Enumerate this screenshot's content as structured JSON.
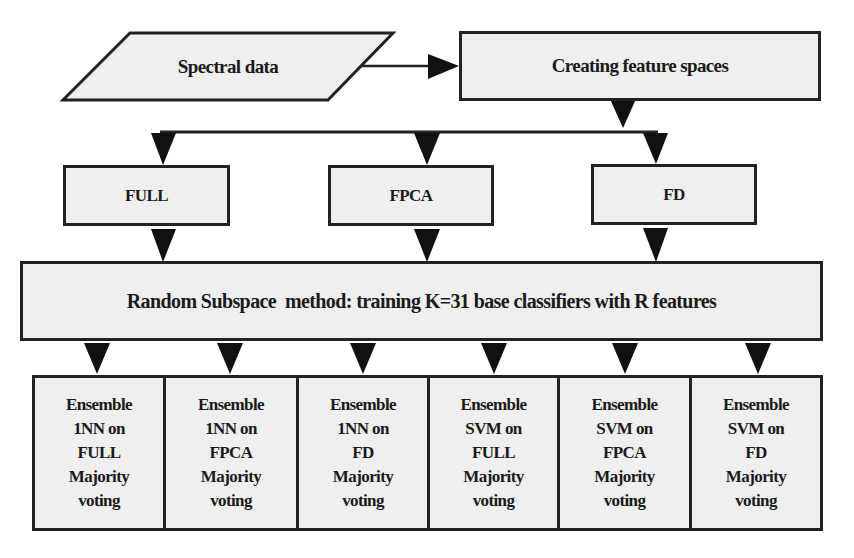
{
  "diagram": {
    "input": {
      "label": "Spectral data",
      "shape": "parallelogram"
    },
    "feature_step": {
      "label": "Creating feature spaces"
    },
    "feature_spaces": [
      {
        "label": "FULL"
      },
      {
        "label": "FPCA"
      },
      {
        "label": "FD"
      }
    ],
    "method": {
      "label": "Random Subspace  method: training K=31 base classifiers with R features"
    },
    "ensembles": [
      {
        "line1": "Ensemble",
        "line2": "1NN on",
        "line3": "FULL",
        "line4": "Majority",
        "line5": "voting"
      },
      {
        "line1": "Ensemble",
        "line2": "1NN on",
        "line3": "FPCA",
        "line4": "Majority",
        "line5": "voting"
      },
      {
        "line1": "Ensemble",
        "line2": "1NN on",
        "line3": "FD",
        "line4": "Majority",
        "line5": "voting"
      },
      {
        "line1": "Ensemble",
        "line2": "SVM on",
        "line3": "FULL",
        "line4": "Majority",
        "line5": "voting"
      },
      {
        "line1": "Ensemble",
        "line2": "SVM on",
        "line3": "FPCA",
        "line4": "Majority",
        "line5": "voting"
      },
      {
        "line1": "Ensemble",
        "line2": "SVM on",
        "line3": "FD",
        "line4": "Majority",
        "line5": "voting"
      }
    ],
    "colors": {
      "box_fill": "#efefef",
      "stroke": "#222222",
      "text": "#1a1a1a"
    }
  }
}
